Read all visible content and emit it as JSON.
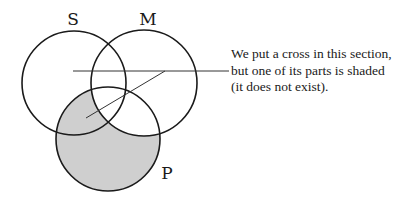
{
  "diagram": {
    "type": "venn",
    "sets": [
      {
        "id": "S",
        "label": "S"
      },
      {
        "id": "M",
        "label": "M"
      },
      {
        "id": "P",
        "label": "P"
      }
    ],
    "shaded_regions": [
      "S∩P∖M",
      "P∖(S∪M)"
    ],
    "cross_region": "S∩P",
    "colors": {
      "stroke": "#1a1a1a",
      "shade": "#cfcfcf",
      "background": "#ffffff"
    }
  },
  "annotation": {
    "lines": [
      "We put a cross in this section,",
      "but one of its parts is shaded",
      "(it does not exist)."
    ]
  }
}
